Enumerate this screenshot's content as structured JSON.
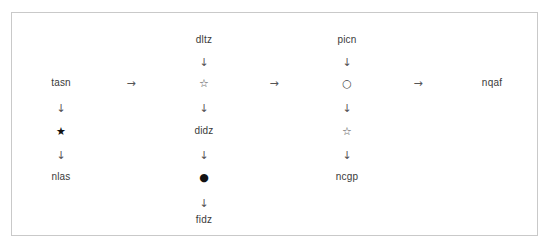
{
  "diagram": {
    "type": "node-chain-diagram",
    "frame": {
      "border_color": "#c9c9c9",
      "background_color": "#ffffff"
    },
    "glyphs": {
      "arrow_right": "→",
      "arrow_down": "↓",
      "star_filled": "★",
      "star_hollow": "☆",
      "circle_filled": "●",
      "circle_hollow": "○"
    },
    "columns": [
      {
        "id": "column-1",
        "nodes": [
          {
            "id": "c1-n1",
            "kind": "label",
            "text": "tasn"
          },
          {
            "id": "c1-a1",
            "kind": "arrow",
            "text": "↓"
          },
          {
            "id": "c1-n2",
            "kind": "symbol",
            "text": "★"
          },
          {
            "id": "c1-a2",
            "kind": "arrow",
            "text": "↓"
          },
          {
            "id": "c1-n3",
            "kind": "label",
            "text": "nlas"
          }
        ]
      },
      {
        "id": "column-2",
        "nodes": [
          {
            "id": "c2-n1",
            "kind": "label",
            "text": "dltz"
          },
          {
            "id": "c2-a1",
            "kind": "arrow",
            "text": "↓"
          },
          {
            "id": "c2-n2",
            "kind": "symbol",
            "text": "☆"
          },
          {
            "id": "c2-a2",
            "kind": "arrow",
            "text": "↓"
          },
          {
            "id": "c2-n3",
            "kind": "label",
            "text": "didz"
          },
          {
            "id": "c2-a3",
            "kind": "arrow",
            "text": "↓"
          },
          {
            "id": "c2-n4",
            "kind": "symbol",
            "text": "●"
          },
          {
            "id": "c2-a4",
            "kind": "arrow",
            "text": "↓"
          },
          {
            "id": "c2-n5",
            "kind": "label",
            "text": "fidz"
          }
        ]
      },
      {
        "id": "column-3",
        "nodes": [
          {
            "id": "c3-n1",
            "kind": "label",
            "text": "picn"
          },
          {
            "id": "c3-a1",
            "kind": "arrow",
            "text": "↓"
          },
          {
            "id": "c3-n2",
            "kind": "symbol",
            "text": "○"
          },
          {
            "id": "c3-a2",
            "kind": "arrow",
            "text": "↓"
          },
          {
            "id": "c3-n3",
            "kind": "symbol",
            "text": "☆"
          },
          {
            "id": "c3-a3",
            "kind": "arrow",
            "text": "↓"
          },
          {
            "id": "c3-n4",
            "kind": "label",
            "text": "ncgp"
          }
        ]
      },
      {
        "id": "column-4",
        "nodes": [
          {
            "id": "c4-n1",
            "kind": "label",
            "text": "nqaf"
          }
        ]
      }
    ],
    "horizontal_arrows": [
      {
        "id": "h-arrow-1",
        "text": "→"
      },
      {
        "id": "h-arrow-2",
        "text": "→"
      },
      {
        "id": "h-arrow-3",
        "text": "→"
      }
    ]
  }
}
